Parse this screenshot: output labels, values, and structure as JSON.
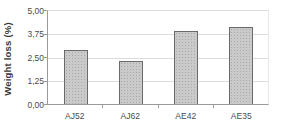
{
  "chart_data": {
    "type": "bar",
    "title": "",
    "xlabel": "",
    "ylabel": "Weight loss (%)",
    "categories": [
      "AJ52",
      "AJ62",
      "AE42",
      "AE35"
    ],
    "values": [
      2.9,
      2.3,
      3.9,
      4.15
    ],
    "ylim": [
      0,
      5
    ],
    "ytick_values": [
      0,
      1.25,
      2.5,
      3.75,
      5
    ],
    "ytick_labels": [
      "0,00",
      "1,25",
      "2,50",
      "3,75",
      "5,00"
    ],
    "decimal_separator": ",",
    "grid": "horizontal-only",
    "legend": "none",
    "colors": {
      "bar_fill": "#cacaca",
      "bar_pattern_dots": "#a8a8a8",
      "bar_border": "#6a6a6a",
      "gridline": "#dcdcdc",
      "axis": "#9a9a9a",
      "text": "#4a4a4a",
      "background": "#ffffff"
    }
  }
}
